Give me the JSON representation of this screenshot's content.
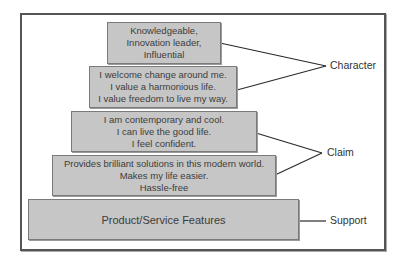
{
  "diagram": {
    "type": "pyramid",
    "tiers": [
      {
        "id": "tier-1",
        "lines": [
          "Knowledgeable,",
          "Innovation leader,",
          "Influential"
        ]
      },
      {
        "id": "tier-2",
        "lines": [
          "I welcome change around me.",
          "I value a harmonious life.",
          "I value freedom to live my way."
        ]
      },
      {
        "id": "tier-3",
        "lines": [
          "I am contemporary and cool.",
          "I can live the good life.",
          "I feel confident."
        ]
      },
      {
        "id": "tier-4",
        "lines": [
          "Provides brilliant solutions in this modern world.",
          "Makes my life easier.",
          "Hassle-free"
        ]
      },
      {
        "id": "tier-5",
        "lines": [
          "Product/Service Features"
        ]
      }
    ],
    "groups": [
      {
        "label": "Character",
        "tiers": [
          "tier-1",
          "tier-2"
        ]
      },
      {
        "label": "Claim",
        "tiers": [
          "tier-3",
          "tier-4"
        ]
      },
      {
        "label": "Support",
        "tiers": [
          "tier-5"
        ]
      }
    ],
    "colors": {
      "box_fill": "#c6c6c6",
      "box_border": "#7a7a7a",
      "frame_border": "#555555",
      "text": "#3c3c3c",
      "connector": "#2a2a2a"
    }
  }
}
